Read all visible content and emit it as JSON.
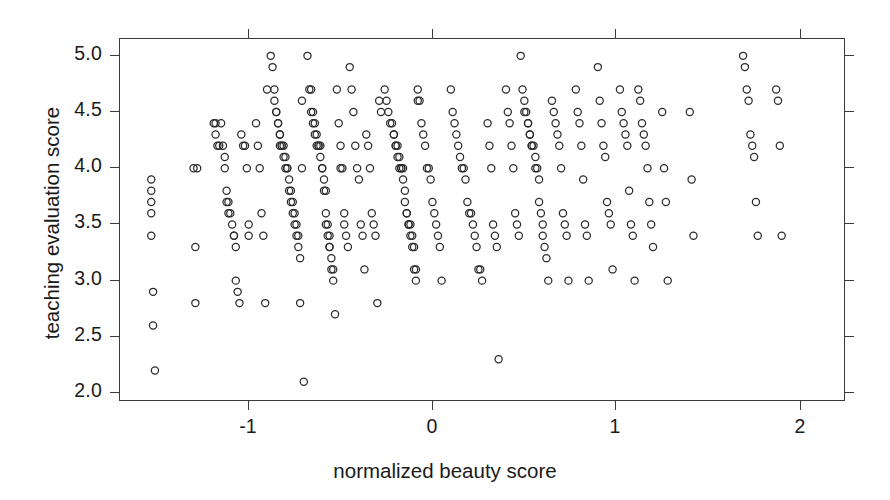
{
  "chart_data": {
    "type": "scatter",
    "title": "",
    "xlabel": "normalized beauty score",
    "ylabel": "teaching evaluation score",
    "xlim": [
      -1.62,
      2.33
    ],
    "ylim": [
      1.92,
      5.15
    ],
    "xticks": [
      -1,
      0,
      1,
      2
    ],
    "xticklabels": [
      "-1",
      "0",
      "1",
      "2"
    ],
    "yticks": [
      2.0,
      2.5,
      3.0,
      3.5,
      4.0,
      4.5,
      5.0
    ],
    "yticklabels": [
      "2.0",
      "2.5",
      "3.0",
      "3.5",
      "4.0",
      "4.5",
      "5.0"
    ],
    "grid": false,
    "legend": null,
    "marker": "open-circle",
    "marker_color": "#2b2b2b",
    "marker_size": 5,
    "n_points": 463,
    "series": [
      {
        "name": "course evaluations",
        "points": [
          [
            -1.45,
            3.9
          ],
          [
            -1.45,
            3.8
          ],
          [
            -1.45,
            3.7
          ],
          [
            -1.45,
            3.6
          ],
          [
            -1.45,
            3.4
          ],
          [
            -1.44,
            2.9
          ],
          [
            -1.44,
            2.6
          ],
          [
            -1.43,
            2.2
          ],
          [
            -1.22,
            4.0
          ],
          [
            -1.21,
            3.3
          ],
          [
            -1.21,
            2.8
          ],
          [
            -1.2,
            4.0
          ],
          [
            -1.11,
            4.4
          ],
          [
            -1.1,
            4.4
          ],
          [
            -1.1,
            4.3
          ],
          [
            -1.09,
            4.2
          ],
          [
            -1.08,
            4.2
          ],
          [
            -1.07,
            4.4
          ],
          [
            -1.06,
            4.2
          ],
          [
            -1.05,
            4.1
          ],
          [
            -1.05,
            4.0
          ],
          [
            -1.04,
            3.8
          ],
          [
            -1.04,
            3.7
          ],
          [
            -1.03,
            3.7
          ],
          [
            -1.03,
            3.6
          ],
          [
            -1.02,
            3.6
          ],
          [
            -1.01,
            3.5
          ],
          [
            -1.0,
            3.4
          ],
          [
            -1.0,
            3.4
          ],
          [
            -0.99,
            3.3
          ],
          [
            -0.99,
            3.0
          ],
          [
            -0.98,
            2.9
          ],
          [
            -0.97,
            2.8
          ],
          [
            -0.96,
            4.3
          ],
          [
            -0.95,
            4.2
          ],
          [
            -0.94,
            4.2
          ],
          [
            -0.93,
            4.0
          ],
          [
            -0.92,
            3.5
          ],
          [
            -0.92,
            3.4
          ],
          [
            -0.88,
            4.4
          ],
          [
            -0.87,
            4.2
          ],
          [
            -0.86,
            4.0
          ],
          [
            -0.85,
            3.6
          ],
          [
            -0.84,
            3.4
          ],
          [
            -0.83,
            2.8
          ],
          [
            -0.82,
            4.7
          ],
          [
            -0.8,
            5.0
          ],
          [
            -0.79,
            4.9
          ],
          [
            -0.78,
            4.7
          ],
          [
            -0.78,
            4.6
          ],
          [
            -0.77,
            4.5
          ],
          [
            -0.77,
            4.5
          ],
          [
            -0.76,
            4.4
          ],
          [
            -0.76,
            4.4
          ],
          [
            -0.75,
            4.3
          ],
          [
            -0.75,
            4.3
          ],
          [
            -0.75,
            4.2
          ],
          [
            -0.74,
            4.2
          ],
          [
            -0.74,
            4.2
          ],
          [
            -0.73,
            4.2
          ],
          [
            -0.73,
            4.1
          ],
          [
            -0.72,
            4.1
          ],
          [
            -0.72,
            4.0
          ],
          [
            -0.71,
            4.0
          ],
          [
            -0.71,
            4.0
          ],
          [
            -0.7,
            3.9
          ],
          [
            -0.7,
            3.8
          ],
          [
            -0.69,
            3.8
          ],
          [
            -0.69,
            3.7
          ],
          [
            -0.68,
            3.7
          ],
          [
            -0.68,
            3.6
          ],
          [
            -0.67,
            3.6
          ],
          [
            -0.67,
            3.5
          ],
          [
            -0.66,
            3.5
          ],
          [
            -0.66,
            3.4
          ],
          [
            -0.65,
            3.4
          ],
          [
            -0.65,
            3.3
          ],
          [
            -0.64,
            3.2
          ],
          [
            -0.64,
            2.8
          ],
          [
            -0.63,
            4.0
          ],
          [
            -0.63,
            4.6
          ],
          [
            -0.62,
            2.1
          ],
          [
            -0.6,
            5.0
          ],
          [
            -0.59,
            4.7
          ],
          [
            -0.58,
            4.7
          ],
          [
            -0.58,
            4.5
          ],
          [
            -0.57,
            4.5
          ],
          [
            -0.57,
            4.4
          ],
          [
            -0.56,
            4.4
          ],
          [
            -0.56,
            4.3
          ],
          [
            -0.55,
            4.3
          ],
          [
            -0.55,
            4.2
          ],
          [
            -0.54,
            4.2
          ],
          [
            -0.54,
            4.2
          ],
          [
            -0.53,
            4.2
          ],
          [
            -0.53,
            4.1
          ],
          [
            -0.52,
            4.0
          ],
          [
            -0.52,
            4.0
          ],
          [
            -0.51,
            3.9
          ],
          [
            -0.51,
            3.8
          ],
          [
            -0.5,
            3.8
          ],
          [
            -0.5,
            3.6
          ],
          [
            -0.5,
            3.5
          ],
          [
            -0.49,
            3.5
          ],
          [
            -0.49,
            3.4
          ],
          [
            -0.48,
            3.4
          ],
          [
            -0.48,
            3.3
          ],
          [
            -0.48,
            3.3
          ],
          [
            -0.47,
            3.2
          ],
          [
            -0.47,
            3.1
          ],
          [
            -0.46,
            3.1
          ],
          [
            -0.46,
            3.0
          ],
          [
            -0.45,
            2.7
          ],
          [
            -0.44,
            4.7
          ],
          [
            -0.43,
            4.4
          ],
          [
            -0.42,
            4.2
          ],
          [
            -0.42,
            4.0
          ],
          [
            -0.41,
            4.0
          ],
          [
            -0.4,
            3.6
          ],
          [
            -0.4,
            3.5
          ],
          [
            -0.39,
            3.4
          ],
          [
            -0.38,
            3.3
          ],
          [
            -0.37,
            4.9
          ],
          [
            -0.36,
            4.7
          ],
          [
            -0.35,
            4.5
          ],
          [
            -0.34,
            4.2
          ],
          [
            -0.33,
            4.0
          ],
          [
            -0.32,
            3.9
          ],
          [
            -0.31,
            3.5
          ],
          [
            -0.3,
            3.4
          ],
          [
            -0.29,
            3.1
          ],
          [
            -0.28,
            4.3
          ],
          [
            -0.27,
            4.2
          ],
          [
            -0.26,
            4.0
          ],
          [
            -0.25,
            3.6
          ],
          [
            -0.24,
            3.5
          ],
          [
            -0.23,
            3.4
          ],
          [
            -0.22,
            2.8
          ],
          [
            -0.21,
            4.6
          ],
          [
            -0.2,
            4.5
          ],
          [
            -0.18,
            4.7
          ],
          [
            -0.17,
            4.6
          ],
          [
            -0.16,
            4.5
          ],
          [
            -0.15,
            4.4
          ],
          [
            -0.14,
            4.4
          ],
          [
            -0.13,
            4.3
          ],
          [
            -0.13,
            4.3
          ],
          [
            -0.12,
            4.2
          ],
          [
            -0.12,
            4.2
          ],
          [
            -0.11,
            4.2
          ],
          [
            -0.11,
            4.1
          ],
          [
            -0.1,
            4.1
          ],
          [
            -0.1,
            4.0
          ],
          [
            -0.09,
            4.0
          ],
          [
            -0.09,
            4.0
          ],
          [
            -0.08,
            4.0
          ],
          [
            -0.08,
            3.9
          ],
          [
            -0.07,
            3.8
          ],
          [
            -0.07,
            3.7
          ],
          [
            -0.06,
            3.6
          ],
          [
            -0.06,
            3.6
          ],
          [
            -0.05,
            3.5
          ],
          [
            -0.05,
            3.5
          ],
          [
            -0.04,
            3.5
          ],
          [
            -0.04,
            3.4
          ],
          [
            -0.03,
            3.4
          ],
          [
            -0.03,
            3.3
          ],
          [
            -0.02,
            3.3
          ],
          [
            -0.02,
            3.1
          ],
          [
            -0.01,
            3.1
          ],
          [
            -0.01,
            3.0
          ],
          [
            0.0,
            4.7
          ],
          [
            0.0,
            4.6
          ],
          [
            0.01,
            4.6
          ],
          [
            0.02,
            4.4
          ],
          [
            0.03,
            4.3
          ],
          [
            0.04,
            4.2
          ],
          [
            0.05,
            4.0
          ],
          [
            0.06,
            4.0
          ],
          [
            0.07,
            3.9
          ],
          [
            0.08,
            3.7
          ],
          [
            0.09,
            3.6
          ],
          [
            0.1,
            3.5
          ],
          [
            0.11,
            3.4
          ],
          [
            0.12,
            3.3
          ],
          [
            0.13,
            3.0
          ],
          [
            0.18,
            4.7
          ],
          [
            0.19,
            4.5
          ],
          [
            0.2,
            4.4
          ],
          [
            0.21,
            4.3
          ],
          [
            0.22,
            4.2
          ],
          [
            0.23,
            4.1
          ],
          [
            0.24,
            4.0
          ],
          [
            0.25,
            4.0
          ],
          [
            0.26,
            3.9
          ],
          [
            0.27,
            3.7
          ],
          [
            0.28,
            3.6
          ],
          [
            0.29,
            3.6
          ],
          [
            0.3,
            3.5
          ],
          [
            0.31,
            3.4
          ],
          [
            0.32,
            3.3
          ],
          [
            0.33,
            3.1
          ],
          [
            0.34,
            3.1
          ],
          [
            0.35,
            3.0
          ],
          [
            0.38,
            4.4
          ],
          [
            0.39,
            4.2
          ],
          [
            0.4,
            4.0
          ],
          [
            0.41,
            3.5
          ],
          [
            0.42,
            3.4
          ],
          [
            0.43,
            3.3
          ],
          [
            0.44,
            2.3
          ],
          [
            0.48,
            4.7
          ],
          [
            0.49,
            4.5
          ],
          [
            0.5,
            4.4
          ],
          [
            0.51,
            4.2
          ],
          [
            0.52,
            4.0
          ],
          [
            0.53,
            3.6
          ],
          [
            0.54,
            3.5
          ],
          [
            0.55,
            3.4
          ],
          [
            0.56,
            5.0
          ],
          [
            0.57,
            4.7
          ],
          [
            0.58,
            4.6
          ],
          [
            0.58,
            4.5
          ],
          [
            0.59,
            4.5
          ],
          [
            0.6,
            4.4
          ],
          [
            0.6,
            4.4
          ],
          [
            0.61,
            4.3
          ],
          [
            0.61,
            4.3
          ],
          [
            0.62,
            4.2
          ],
          [
            0.62,
            4.2
          ],
          [
            0.63,
            4.2
          ],
          [
            0.64,
            4.1
          ],
          [
            0.64,
            4.0
          ],
          [
            0.65,
            4.0
          ],
          [
            0.66,
            3.9
          ],
          [
            0.66,
            3.7
          ],
          [
            0.67,
            3.6
          ],
          [
            0.68,
            3.5
          ],
          [
            0.68,
            3.4
          ],
          [
            0.69,
            3.3
          ],
          [
            0.7,
            3.2
          ],
          [
            0.71,
            3.0
          ],
          [
            0.73,
            4.6
          ],
          [
            0.74,
            4.5
          ],
          [
            0.75,
            4.4
          ],
          [
            0.76,
            4.3
          ],
          [
            0.77,
            4.2
          ],
          [
            0.78,
            4.0
          ],
          [
            0.79,
            3.6
          ],
          [
            0.8,
            3.5
          ],
          [
            0.81,
            3.4
          ],
          [
            0.82,
            3.0
          ],
          [
            0.86,
            4.7
          ],
          [
            0.87,
            4.5
          ],
          [
            0.88,
            4.4
          ],
          [
            0.89,
            4.2
          ],
          [
            0.9,
            3.9
          ],
          [
            0.91,
            3.5
          ],
          [
            0.92,
            3.4
          ],
          [
            0.93,
            3.0
          ],
          [
            0.98,
            4.9
          ],
          [
            0.99,
            4.6
          ],
          [
            1.0,
            4.4
          ],
          [
            1.01,
            4.2
          ],
          [
            1.02,
            4.1
          ],
          [
            1.03,
            3.7
          ],
          [
            1.04,
            3.6
          ],
          [
            1.05,
            3.5
          ],
          [
            1.06,
            3.1
          ],
          [
            1.1,
            4.7
          ],
          [
            1.11,
            4.5
          ],
          [
            1.12,
            4.4
          ],
          [
            1.13,
            4.3
          ],
          [
            1.14,
            4.2
          ],
          [
            1.15,
            3.8
          ],
          [
            1.16,
            3.5
          ],
          [
            1.17,
            3.4
          ],
          [
            1.18,
            3.0
          ],
          [
            1.2,
            4.7
          ],
          [
            1.21,
            4.6
          ],
          [
            1.22,
            4.4
          ],
          [
            1.23,
            4.3
          ],
          [
            1.24,
            4.2
          ],
          [
            1.25,
            4.0
          ],
          [
            1.26,
            3.7
          ],
          [
            1.27,
            3.5
          ],
          [
            1.28,
            3.3
          ],
          [
            1.33,
            4.5
          ],
          [
            1.34,
            4.0
          ],
          [
            1.35,
            3.7
          ],
          [
            1.36,
            3.0
          ],
          [
            1.48,
            4.5
          ],
          [
            1.49,
            3.9
          ],
          [
            1.5,
            3.4
          ],
          [
            1.77,
            5.0
          ],
          [
            1.78,
            4.9
          ],
          [
            1.79,
            4.7
          ],
          [
            1.8,
            4.6
          ],
          [
            1.81,
            4.3
          ],
          [
            1.82,
            4.2
          ],
          [
            1.83,
            4.1
          ],
          [
            1.84,
            3.7
          ],
          [
            1.85,
            3.4
          ],
          [
            1.95,
            4.7
          ],
          [
            1.96,
            4.6
          ],
          [
            1.97,
            4.2
          ],
          [
            1.98,
            3.4
          ]
        ]
      }
    ]
  },
  "axes": {
    "x_tick_positions_px": [
      248,
      432,
      615,
      800
    ],
    "y_tick_values": [
      5.0,
      4.5,
      4.0,
      3.5,
      3.0,
      2.5,
      2.0
    ]
  }
}
